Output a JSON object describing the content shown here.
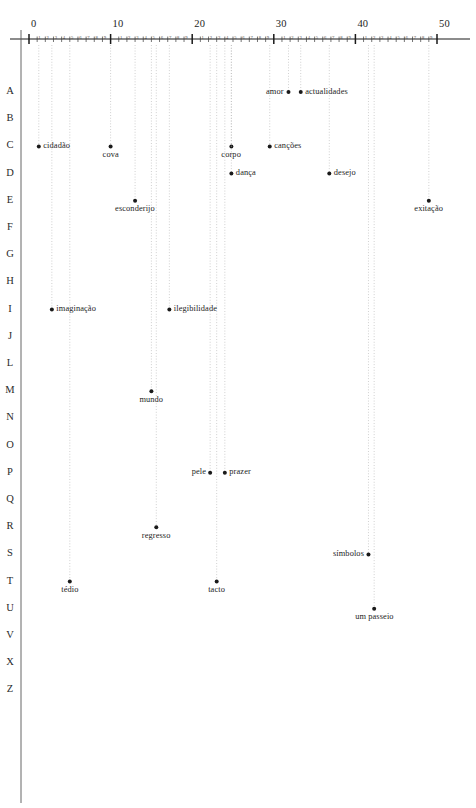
{
  "figure": {
    "title": "",
    "background_color": "#ffffff",
    "ink_color": "#1a1a1a",
    "guide_color": "#b9b9b9"
  },
  "chart_data": {
    "type": "scatter",
    "title": "",
    "xlabel": "",
    "ylabel": "",
    "xlim": [
      -1,
      52
    ],
    "grid": true,
    "grid_note": "dotted vertical guide lines drop from the top axis through each plotted point",
    "legend": "none",
    "x_axis": {
      "position": "top",
      "major_ticks": [
        0,
        10,
        20,
        30,
        40,
        50
      ],
      "major_tick_labels": [
        "0",
        "10",
        "20",
        "30",
        "40",
        "50"
      ],
      "minor_tick_labels": [
        "1",
        "2",
        "3",
        "4",
        "5",
        "6",
        "7",
        "8",
        "9"
      ],
      "minor_ticks_per_major": 9
    },
    "y_axis": {
      "position": "left",
      "categories": [
        "A",
        "B",
        "C",
        "D",
        "E",
        "F",
        "G",
        "H",
        "I",
        "J",
        "L",
        "M",
        "N",
        "O",
        "P",
        "Q",
        "R",
        "S",
        "T",
        "U",
        "V",
        "X",
        "Z"
      ],
      "note": "Portuguese alphabet rows; K, W and Y are omitted"
    },
    "points": [
      {
        "label": "amor",
        "row": "A",
        "x": 31.8,
        "side": "left"
      },
      {
        "label": "actualidades",
        "row": "A",
        "x": 33.3,
        "side": "right"
      },
      {
        "label": "cidadão",
        "row": "C",
        "x": 1.2,
        "side": "right"
      },
      {
        "label": "cova",
        "row": "C",
        "x": 10.0,
        "side": "below"
      },
      {
        "label": "corpo",
        "row": "C",
        "x": 24.8,
        "side": "below"
      },
      {
        "label": "canções",
        "row": "C",
        "x": 29.5,
        "side": "right"
      },
      {
        "label": "dança",
        "row": "D",
        "x": 24.8,
        "side": "right"
      },
      {
        "label": "desejo",
        "row": "D",
        "x": 36.8,
        "side": "right"
      },
      {
        "label": "esconderijo",
        "row": "E",
        "x": 13.0,
        "side": "below"
      },
      {
        "label": "exitação",
        "row": "E",
        "x": 49.0,
        "side": "below"
      },
      {
        "label": "imaginação",
        "row": "I",
        "x": 2.8,
        "side": "right"
      },
      {
        "label": "ilegibilidade",
        "row": "I",
        "x": 17.2,
        "side": "right"
      },
      {
        "label": "mundo",
        "row": "M",
        "x": 15.0,
        "side": "below"
      },
      {
        "label": "pele",
        "row": "P",
        "x": 22.2,
        "side": "left"
      },
      {
        "label": "prazer",
        "row": "P",
        "x": 24.0,
        "side": "right"
      },
      {
        "label": "regresso",
        "row": "R",
        "x": 15.6,
        "side": "below"
      },
      {
        "label": "símbolos",
        "row": "S",
        "x": 41.6,
        "side": "left"
      },
      {
        "label": "tédio",
        "row": "T",
        "x": 5.0,
        "side": "below"
      },
      {
        "label": "tacto",
        "row": "T",
        "x": 23.0,
        "side": "below"
      },
      {
        "label": "um passeio",
        "row": "U",
        "x": 42.3,
        "side": "below"
      }
    ]
  }
}
